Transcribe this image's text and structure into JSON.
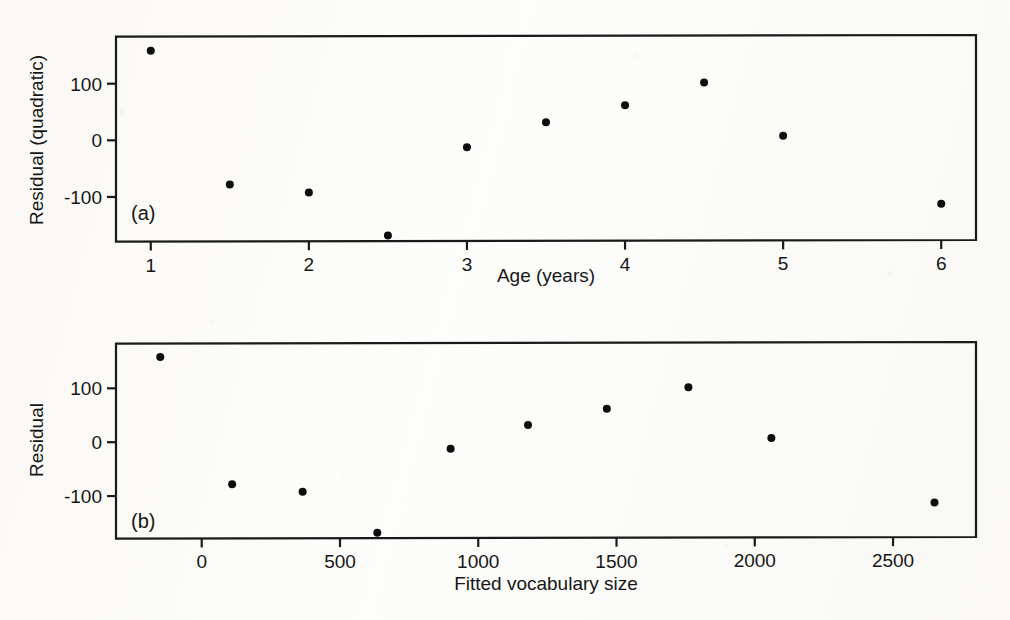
{
  "figure": {
    "kind": "two-panel residual scatter plot",
    "panels": [
      {
        "tag": "(a)"
      },
      {
        "tag": "(b)"
      }
    ]
  },
  "chart_data": [
    {
      "type": "scatter",
      "panel_label": "(a)",
      "title": "",
      "xlabel": "Age (years)",
      "ylabel": "Residual (quadratic)",
      "xlim": [
        0.78,
        6.22
      ],
      "ylim": [
        -176,
        186
      ],
      "grid": false,
      "legend": null,
      "xticks": [
        1,
        2,
        3,
        4,
        5,
        6
      ],
      "xticklabels": [
        "1",
        "2",
        "3",
        "4",
        "5",
        "6"
      ],
      "yticks": [
        100,
        0,
        -100
      ],
      "yticklabels": [
        "100",
        "0",
        "-100"
      ],
      "x": [
        1,
        1.5,
        2,
        2.5,
        3,
        3.5,
        4,
        4.5,
        5,
        6
      ],
      "y": [
        158,
        -78,
        -92,
        -168,
        -12,
        32,
        62,
        102,
        8,
        -112
      ],
      "marker": "filled-circle",
      "marker_color": "#0d0d0d",
      "marker_size": 4
    },
    {
      "type": "scatter",
      "panel_label": "(b)",
      "title": "",
      "xlabel": "Fitted vocabulary size",
      "ylabel": "Residual",
      "xlim": [
        -310,
        2800
      ],
      "ylim": [
        -176,
        186
      ],
      "grid": false,
      "legend": null,
      "xticks": [
        0,
        500,
        1000,
        1500,
        2000,
        2500
      ],
      "xticklabels": [
        "0",
        "500",
        "1000",
        "1500",
        "2000",
        "2500"
      ],
      "yticks": [
        100,
        0,
        -100
      ],
      "yticklabels": [
        "100",
        "0",
        "-100"
      ],
      "x": [
        -150,
        110,
        365,
        635,
        900,
        1180,
        1465,
        1760,
        2060,
        2650
      ],
      "y": [
        158,
        -78,
        -92,
        -168,
        -12,
        32,
        62,
        102,
        8,
        -112
      ],
      "marker": "filled-circle",
      "marker_color": "#0d0d0d",
      "marker_size": 4
    }
  ],
  "colors": {
    "ink": "#1a1a1a",
    "marker": "#0d0d0d",
    "paper": "#fdfdfb"
  }
}
